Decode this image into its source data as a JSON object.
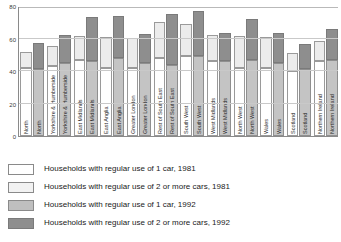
{
  "chart_data": {
    "type": "bar",
    "subtype": "stacked-grouped-bar",
    "title": "",
    "xlabel": "",
    "ylabel": "",
    "ylim": [
      0,
      80
    ],
    "yticks": [
      0,
      20,
      40,
      60,
      80
    ],
    "ytick_labels": [
      "0",
      "20",
      "40",
      "60",
      "80"
    ],
    "grid": true,
    "legend_position": "below",
    "categories": [
      "North",
      "Yorkshire & Humberside",
      "East Midlands",
      "East Anglia",
      "Greater London",
      "Rest of South East",
      "South West",
      "West Midlands",
      "North West",
      "Wales",
      "Scotland",
      "Northern Ireland"
    ],
    "series": [
      {
        "name": "Households with regular use of 1 car, 1981",
        "year": "1981",
        "cars": "1",
        "color": "#ffffff",
        "values": [
          42,
          43,
          47,
          42,
          42,
          48,
          49,
          46,
          42,
          42,
          40,
          46
        ]
      },
      {
        "name": "Households with regular use of 2 or more cars, 1981",
        "year": "1981",
        "cars": "2+",
        "color": "#ececec",
        "values": [
          9.5,
          12.5,
          14.5,
          19,
          18.5,
          22,
          20,
          16,
          19.5,
          19,
          11,
          12.5
        ]
      },
      {
        "name": "Households with regular use of 1 car, 1992",
        "year": "1992",
        "cars": "1",
        "color": "#c4c4c4",
        "values": [
          41,
          45,
          46,
          48,
          45,
          44,
          49,
          46,
          47,
          45,
          41,
          47
        ]
      },
      {
        "name": "Households with regular use of 2 or more cars, 1992",
        "year": "1992",
        "cars": "2+",
        "color": "#8e8e8e",
        "values": [
          16,
          17,
          27,
          26,
          18,
          31,
          28,
          17.5,
          25,
          18.5,
          15.5,
          19
        ]
      }
    ],
    "bar_totals": {
      "1981": [
        51.5,
        55.5,
        61.5,
        61,
        60.5,
        70,
        69,
        62,
        61.5,
        61,
        51,
        58.5
      ],
      "1992": [
        57,
        62,
        73,
        74,
        63,
        75,
        77,
        63.5,
        71.5,
        63.5,
        56.5,
        66
      ]
    }
  },
  "legend": {
    "items": [
      {
        "label": "Households with regular use of 1 car, 1981",
        "swatch": "sw1"
      },
      {
        "label": "Households with regular use of 2 or more cars, 1981",
        "swatch": "sw2"
      },
      {
        "label": "Households with regular use of 1 car, 1992",
        "swatch": "sw3"
      },
      {
        "label": "Households with regular use of 2 or more cars, 1992",
        "swatch": "sw4"
      }
    ]
  },
  "axis": {
    "y_ticks": [
      "0",
      "20",
      "40",
      "60",
      "80"
    ]
  }
}
